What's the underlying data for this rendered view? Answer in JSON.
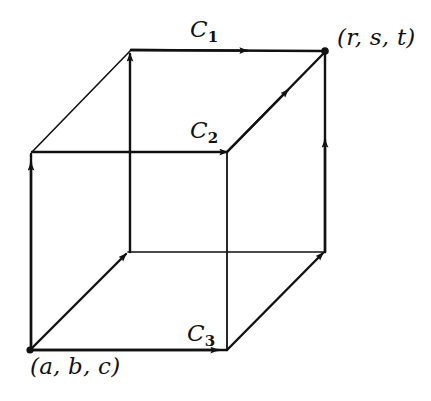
{
  "figure": {
    "kind": "cube-diagram-with-oriented-curves",
    "background_color": "#ffffff",
    "stroke_color": "#111111",
    "labels": {
      "c1": "C",
      "c1_sub": "1",
      "c2": "C",
      "c2_sub": "2",
      "c3": "C",
      "c3_sub": "3",
      "start_point": "(a, b, c)",
      "end_point": "(r, s, t)"
    },
    "vertices": {
      "front_bottom_left": "(a, b, c)",
      "top_back_right": "(r, s, t)"
    },
    "paths": [
      {
        "name": "C1",
        "description": "up front-left edge, back along top-left diagonal, right across top back edge to (r,s,t)"
      },
      {
        "name": "C2",
        "description": "up left edge, right across middle horizontal, diagonal up-right to (r,s,t)"
      },
      {
        "name": "C3",
        "description": "right across bottom front edge, diagonal up-right, up right vertical edge to (r,s,t)"
      }
    ]
  }
}
